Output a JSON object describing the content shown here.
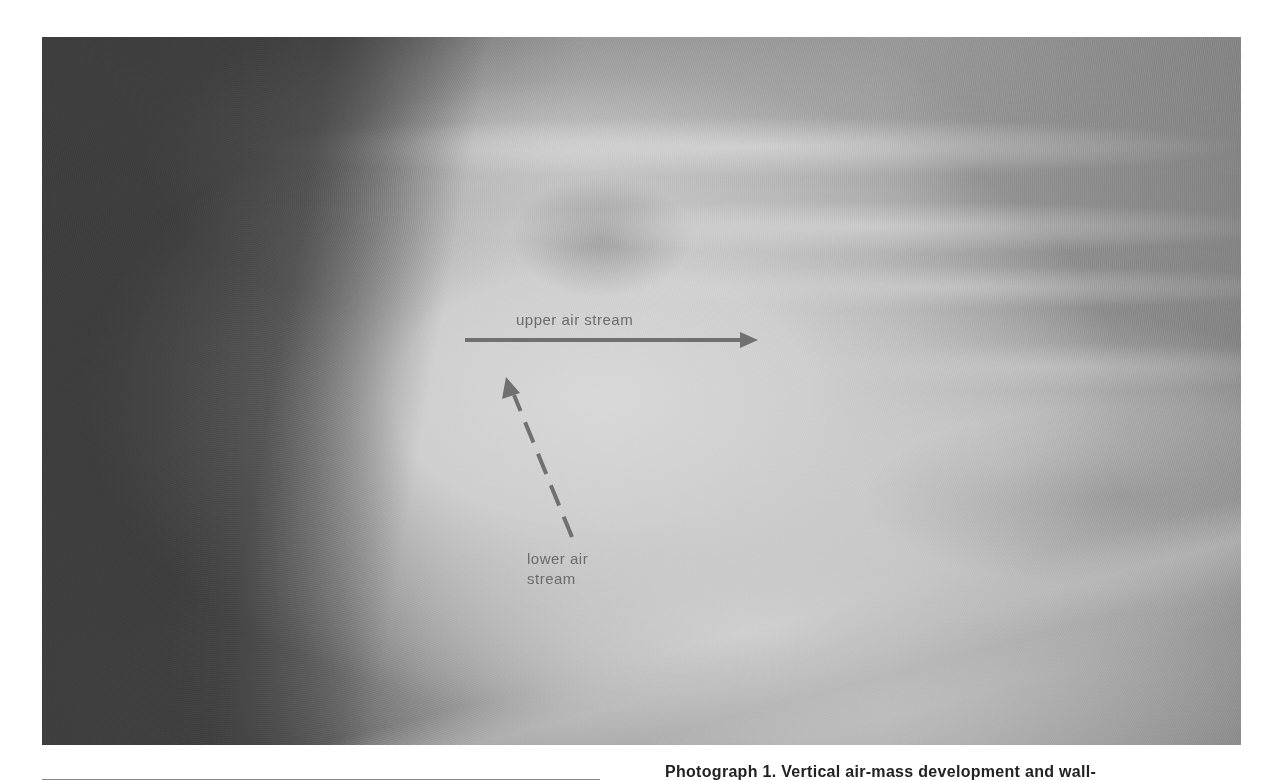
{
  "photo": {
    "description": "Aerial photograph of cloud formation showing air streams",
    "annotations": {
      "upper": {
        "label": "upper air stream",
        "arrow": "solid",
        "direction": "right",
        "color": "#6b6b6b"
      },
      "lower": {
        "label_line1": "lower air",
        "label_line2": "stream",
        "arrow": "dashed",
        "direction": "up-left",
        "color": "#6b6b6b"
      }
    }
  },
  "caption": {
    "text": "Photograph 1. Vertical air-mass development and wall-"
  }
}
